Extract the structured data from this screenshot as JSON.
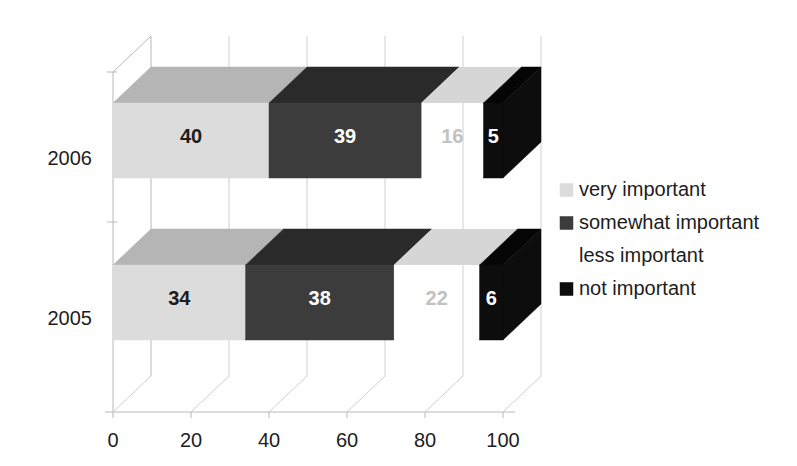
{
  "chart_data": {
    "type": "bar",
    "orientation": "horizontal",
    "stacked": true,
    "style": "3d",
    "title": "",
    "subtitle": "",
    "xlabel": "",
    "ylabel": "",
    "categories": [
      "2006",
      "2005"
    ],
    "xticks": [
      "0",
      "20",
      "40",
      "60",
      "80",
      "100"
    ],
    "xlim": [
      0,
      100
    ],
    "grid": true,
    "legend_position": "right",
    "series": [
      {
        "name": "very important",
        "color": "#dcdcdc",
        "top_color": "#b5b5b5",
        "label_color": "#1d1d1d",
        "values": [
          40,
          34
        ]
      },
      {
        "name": "somewhat important",
        "color": "#3c3c3c",
        "top_color": "#2a2a2a",
        "label_color": "#ffffff",
        "values": [
          39,
          38
        ]
      },
      {
        "name": "less important",
        "color": "#ffffff",
        "top_color": "#d6d6d6",
        "label_color": "#c2c2c2",
        "values": [
          16,
          22
        ]
      },
      {
        "name": "not important",
        "color": "#0d0d0d",
        "top_color": "#050505",
        "label_color": "#ffffff",
        "values": [
          5,
          6
        ]
      }
    ],
    "bar_labels": {
      "2006": [
        "40",
        "39",
        "16",
        "5"
      ],
      "2005": [
        "34",
        "38",
        "22",
        "6"
      ]
    }
  },
  "legend": {
    "items": [
      {
        "label": "very important",
        "swatch": "#dcdcdc",
        "swatch_visible": true
      },
      {
        "label": "somewhat important",
        "swatch": "#3c3c3c",
        "swatch_visible": true
      },
      {
        "label": "less important",
        "swatch": "#ffffff",
        "swatch_visible": false
      },
      {
        "label": "not important",
        "swatch": "#0d0d0d",
        "swatch_visible": true
      }
    ]
  },
  "axis": {
    "x_tick_labels": [
      "0",
      "20",
      "40",
      "60",
      "80",
      "100"
    ],
    "y_tick_labels": [
      "2006",
      "2005"
    ]
  },
  "colors": {
    "background": "#ffffff",
    "grid": "#cfcfcf",
    "axis": "#b8b8b8",
    "text": "#1d1d1d"
  }
}
